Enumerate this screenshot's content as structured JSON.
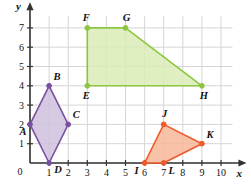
{
  "chart_data": {
    "type": "scatter",
    "title": "",
    "xlabel": "x",
    "ylabel": "y",
    "xlim": [
      0,
      10.6
    ],
    "ylim": [
      0,
      7.6
    ],
    "grid": true,
    "grid_step": 1,
    "legend": "none",
    "x_ticks": [
      "0",
      "1",
      "2",
      "3",
      "4",
      "5",
      "6",
      "7",
      "8",
      "9",
      "10"
    ],
    "y_ticks": [
      "0",
      "1",
      "2",
      "3",
      "4",
      "5",
      "6",
      "7"
    ],
    "origin_label": "0",
    "shapes": [
      {
        "name": "rhombus-abcd",
        "kind": "polygon",
        "fill": "#cfc0dd",
        "stroke": "#7b4fa0",
        "vertices": [
          {
            "label": "A",
            "x": 0,
            "y": 2,
            "label_dx": -7,
            "label_dy": 11
          },
          {
            "label": "B",
            "x": 1,
            "y": 4,
            "label_dx": 8,
            "label_dy": -6
          },
          {
            "label": "C",
            "x": 2,
            "y": 2,
            "label_dx": 8,
            "label_dy": -6
          },
          {
            "label": "D",
            "x": 1,
            "y": 0,
            "label_dx": 9,
            "label_dy": 10
          }
        ]
      },
      {
        "name": "trapezoid-efgh",
        "kind": "polygon",
        "fill": "#d9ecb7",
        "stroke": "#8cc63f",
        "vertices": [
          {
            "label": "E",
            "x": 3,
            "y": 4,
            "label_dx": -1,
            "label_dy": 13
          },
          {
            "label": "F",
            "x": 3,
            "y": 7,
            "label_dx": -1,
            "label_dy": -7
          },
          {
            "label": "G",
            "x": 5,
            "y": 7,
            "label_dx": 1,
            "label_dy": -7
          },
          {
            "label": "H",
            "x": 9,
            "y": 4,
            "label_dx": 2,
            "label_dy": 13
          }
        ]
      },
      {
        "name": "quadrilateral-ijkl",
        "kind": "polygon",
        "fill": "#f7b799",
        "stroke": "#f05a28",
        "vertices": [
          {
            "label": "I",
            "x": 6,
            "y": 0,
            "label_dx": -8,
            "label_dy": 11
          },
          {
            "label": "J",
            "x": 7,
            "y": 2,
            "label_dx": 1,
            "label_dy": -7
          },
          {
            "label": "K",
            "x": 9,
            "y": 1,
            "label_dx": 8,
            "label_dy": -6
          },
          {
            "label": "L",
            "x": 7,
            "y": 0,
            "label_dx": 8,
            "label_dy": 11
          }
        ]
      }
    ]
  },
  "colors": {
    "grid": "#d5d5d5",
    "axis": "#333333",
    "text": "#111111",
    "purple_fill": "#cfc0dd",
    "purple_stroke": "#7b4fa0",
    "green_fill": "#d9ecb7",
    "green_stroke": "#8cc63f",
    "orange_fill": "#f7b799",
    "orange_stroke": "#f05a28"
  }
}
